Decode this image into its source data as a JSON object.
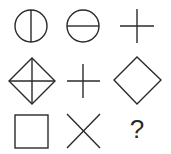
{
  "puzzle": {
    "type": "3x3 figure matrix",
    "stroke_color": "#2a2a2a",
    "background": "#ffffff",
    "rows": [
      [
        {
          "shape": "circle-with-vertical-line",
          "cx": 31,
          "cy": 26,
          "r": 16
        },
        {
          "shape": "circle-with-horizontal-line",
          "cx": 83,
          "cy": 26,
          "r": 16
        },
        {
          "shape": "plus",
          "cx": 137,
          "cy": 26,
          "half": 17
        }
      ],
      [
        {
          "shape": "diamond-with-plus",
          "cx": 32,
          "cy": 81,
          "half": 23
        },
        {
          "shape": "plus",
          "cx": 83,
          "cy": 81,
          "half": 17
        },
        {
          "shape": "diamond",
          "cx": 137,
          "cy": 80,
          "half": 23
        }
      ],
      [
        {
          "shape": "square",
          "x": 15,
          "y": 115,
          "size": 33
        },
        {
          "shape": "x-cross",
          "cx": 83,
          "cy": 131,
          "half": 17
        },
        {
          "shape": "question-mark",
          "label": "?"
        }
      ]
    ],
    "missing_label": "?"
  }
}
